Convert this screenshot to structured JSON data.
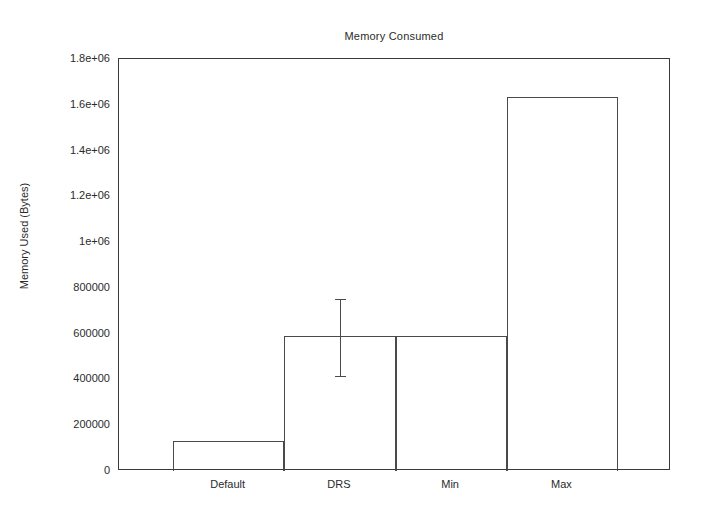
{
  "chart_data": {
    "type": "bar",
    "title": "Memory Consumed",
    "xlabel": "",
    "ylabel": "Memory Used (Bytes)",
    "categories": [
      "Default",
      "DRS",
      "Min",
      "Max"
    ],
    "values": [
      130000,
      590000,
      590000,
      1635000
    ],
    "errors": [
      {
        "category": "DRS",
        "low": 413000,
        "high": 752000
      }
    ],
    "ylim": [
      0,
      1800000
    ],
    "ytick_values": [
      0,
      200000,
      400000,
      600000,
      800000,
      1000000,
      1200000,
      1400000,
      1600000,
      1800000
    ],
    "ytick_labels": [
      "0",
      "200000",
      "400000",
      "600000",
      "800000",
      "1e+06",
      "1.2e+06",
      "1.4e+06",
      "1.6e+06",
      "1.8e+06"
    ],
    "grid": false,
    "legend": null,
    "bar_fill": "#ffffff",
    "bar_stroke": "#4a4a4a",
    "axis_color": "#3a3a3a",
    "background": "#ffffff"
  },
  "axes": {
    "title": "Memory Consumed",
    "y_label": "Memory Used (Bytes)",
    "y_ticks": [
      {
        "label": "1.8e+06",
        "value": 1800000
      },
      {
        "label": "1.6e+06",
        "value": 1600000
      },
      {
        "label": "1.4e+06",
        "value": 1400000
      },
      {
        "label": "1.2e+06",
        "value": 1200000
      },
      {
        "label": "1e+06",
        "value": 1000000
      },
      {
        "label": "800000",
        "value": 800000
      },
      {
        "label": "600000",
        "value": 600000
      },
      {
        "label": "400000",
        "value": 400000
      },
      {
        "label": "200000",
        "value": 200000
      },
      {
        "label": "0",
        "value": 0
      }
    ],
    "x_ticks": [
      {
        "label": "Default",
        "value": 130000
      },
      {
        "label": "DRS",
        "value": 590000
      },
      {
        "label": "Min",
        "value": 590000
      },
      {
        "label": "Max",
        "value": 1635000
      }
    ]
  }
}
